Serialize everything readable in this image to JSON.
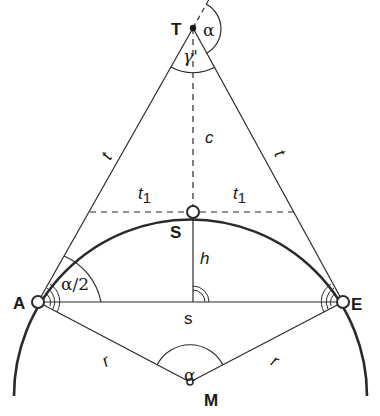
{
  "diagram": {
    "points": {
      "T": {
        "label": "T",
        "x": 193,
        "y": 28
      },
      "S": {
        "label": "S",
        "x": 193,
        "y": 212
      },
      "A": {
        "label": "A",
        "x": 38,
        "y": 302
      },
      "E": {
        "label": "E",
        "x": 343,
        "y": 302
      },
      "M": {
        "label": "M",
        "x": 190,
        "y": 382
      }
    },
    "segment_labels": {
      "tangent_left": "t",
      "tangent_right": "t",
      "half_tangent_left": "t",
      "half_tangent_right": "t",
      "subscript": "1",
      "chord": "s",
      "height": "h",
      "apex_distance": "c",
      "radius_left": "r",
      "radius_right": "r"
    },
    "angle_labels": {
      "apex_external": "α",
      "apex_internal": "γ'",
      "at_A": "α/2",
      "at_M": "α"
    },
    "colors": {
      "stroke": "#2a2a2a",
      "background": "#ffffff"
    }
  }
}
